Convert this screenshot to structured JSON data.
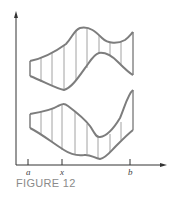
{
  "figure": {
    "caption": "FIGURE 12",
    "colors": {
      "axis": "#333333",
      "curve": "#7d7d7d",
      "hatch": "#8c8c8c",
      "caption": "#8a8a8a"
    },
    "axes": {
      "x_ticks": [
        {
          "label": "a",
          "x": 28
        },
        {
          "label": "x",
          "x": 62
        },
        {
          "label": "b",
          "x": 130
        }
      ]
    },
    "regions": [
      {
        "name": "upper-region",
        "description": "region between two curves from a to b, shaded with vertical lines"
      },
      {
        "name": "lower-region",
        "description": "region between two curves from a to b, shaded with vertical lines"
      }
    ]
  }
}
